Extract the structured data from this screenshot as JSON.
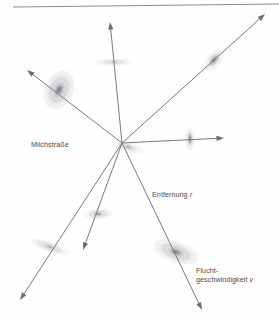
{
  "figure": {
    "title_alt": "Expansion des Universums",
    "background_color": "#fefefe",
    "line_color": "#6b6b72",
    "galaxy_color": "#8a8a92",
    "label_color": "#4a4a4a",
    "rule_color": "#8d8d8d",
    "width": 279,
    "height": 315
  },
  "rule": {
    "name": "top-rule",
    "x1": 13,
    "y1": 7,
    "x2": 279,
    "y2": 4
  },
  "center": {
    "label": "Milchstraße",
    "x": 122,
    "y": 143
  },
  "labels": {
    "milchstrasse": "Milchstraße",
    "entfernung_text": "Entfernung ",
    "entfernung_symbol": "r",
    "flucht_line1": "Flucht-",
    "flucht_line2": "geschwindigkeit ",
    "flucht_symbol": "v"
  },
  "arrows": [
    {
      "name": "arrow-up",
      "x1": 122,
      "y1": 143,
      "x2": 110,
      "y2": 22,
      "head": true
    },
    {
      "name": "arrow-upper-right",
      "x1": 122,
      "y1": 143,
      "x2": 265,
      "y2": 14,
      "head": true
    },
    {
      "name": "arrow-right",
      "x1": 122,
      "y1": 143,
      "x2": 224,
      "y2": 138,
      "head": true
    },
    {
      "name": "arrow-upper-left",
      "x1": 122,
      "y1": 143,
      "x2": 27,
      "y2": 70,
      "head": true
    },
    {
      "name": "arrow-lower-left",
      "x1": 122,
      "y1": 143,
      "x2": 20,
      "y2": 300,
      "head": true
    },
    {
      "name": "arrow-down-left",
      "x1": 122,
      "y1": 143,
      "x2": 83,
      "y2": 250,
      "head": true
    },
    {
      "name": "arrow-lower-right",
      "x1": 122,
      "y1": 143,
      "x2": 202,
      "y2": 310,
      "head": true
    }
  ],
  "galaxies": [
    {
      "name": "galaxy-milky-way",
      "cx": 128,
      "cy": 147,
      "rx": 15,
      "ry": 4.5,
      "rot": 18,
      "rings": 2,
      "core": 0.42,
      "opacity": 0.55
    },
    {
      "name": "galaxy-spiral-upper-left",
      "cx": 59,
      "cy": 90,
      "rx": 13,
      "ry": 19,
      "rot": 24,
      "rings": 5,
      "core": 0.4,
      "opacity": 0.85
    },
    {
      "name": "galaxy-edge-on-top",
      "cx": 114,
      "cy": 62,
      "rx": 17,
      "ry": 2.8,
      "rot": -2,
      "rings": 2,
      "core": 0.3,
      "opacity": 0.6
    },
    {
      "name": "galaxy-upper-right",
      "cx": 214,
      "cy": 60,
      "rx": 6,
      "ry": 11,
      "rot": 38,
      "rings": 2,
      "core": 0.55,
      "opacity": 0.8
    },
    {
      "name": "galaxy-right-edge-on",
      "cx": 190,
      "cy": 139,
      "rx": 4,
      "ry": 10,
      "rot": 0,
      "rings": 2,
      "core": 0.55,
      "opacity": 0.8
    },
    {
      "name": "galaxy-lower-middle",
      "cx": 98,
      "cy": 214,
      "rx": 13,
      "ry": 4.5,
      "rot": -4,
      "rings": 3,
      "core": 0.4,
      "opacity": 0.7
    },
    {
      "name": "galaxy-lower-left",
      "cx": 50,
      "cy": 247,
      "rx": 19,
      "ry": 4,
      "rot": 20,
      "rings": 3,
      "core": 0.32,
      "opacity": 0.65
    },
    {
      "name": "galaxy-spiral-lower-right",
      "cx": 176,
      "cy": 252,
      "rx": 22,
      "ry": 9,
      "rot": 20,
      "rings": 5,
      "core": 0.4,
      "opacity": 0.8
    }
  ]
}
